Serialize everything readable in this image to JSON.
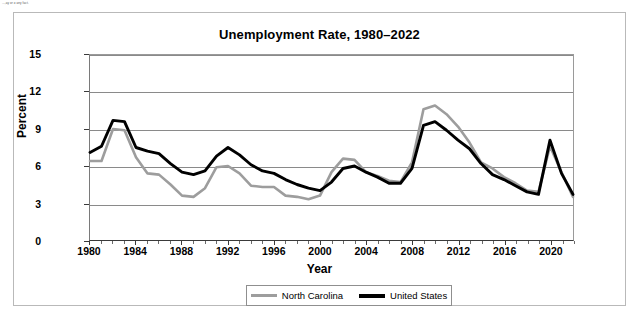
{
  "page": {
    "top_note": "...,ay or o any fact."
  },
  "chart_data": {
    "type": "line",
    "title": "Unemployment Rate, 1980–2022",
    "xlabel": "Year",
    "ylabel": "Percent",
    "xlim": [
      1980,
      2022
    ],
    "ylim": [
      0,
      15
    ],
    "yticks": [
      0,
      3,
      6,
      9,
      12,
      15
    ],
    "xticks": [
      1980,
      1984,
      1988,
      1992,
      1996,
      2000,
      2004,
      2008,
      2012,
      2016,
      2020
    ],
    "grid": "horizontal",
    "legend_position": "bottom",
    "x": [
      1980,
      1981,
      1982,
      1983,
      1984,
      1985,
      1986,
      1987,
      1988,
      1989,
      1990,
      1991,
      1992,
      1993,
      1994,
      1995,
      1996,
      1997,
      1998,
      1999,
      2000,
      2001,
      2002,
      2003,
      2004,
      2005,
      2006,
      2007,
      2008,
      2009,
      2010,
      2011,
      2012,
      2013,
      2014,
      2015,
      2016,
      2017,
      2018,
      2019,
      2020,
      2021,
      2022
    ],
    "series": [
      {
        "name": "North Carolina",
        "color": "#9d9d9d",
        "values": [
          6.4,
          6.4,
          9.0,
          8.9,
          6.7,
          5.4,
          5.3,
          4.5,
          3.6,
          3.5,
          4.2,
          5.9,
          6.0,
          5.4,
          4.4,
          4.3,
          4.3,
          3.6,
          3.5,
          3.3,
          3.6,
          5.5,
          6.6,
          6.5,
          5.5,
          5.2,
          4.8,
          4.7,
          6.3,
          10.6,
          10.9,
          10.2,
          9.2,
          7.9,
          6.3,
          5.8,
          5.1,
          4.6,
          4.0,
          3.9,
          7.6,
          5.5,
          3.5
        ]
      },
      {
        "name": "United States",
        "color": "#000000",
        "values": [
          7.1,
          7.6,
          9.7,
          9.6,
          7.5,
          7.2,
          7.0,
          6.2,
          5.5,
          5.3,
          5.6,
          6.8,
          7.5,
          6.9,
          6.1,
          5.6,
          5.4,
          4.9,
          4.5,
          4.2,
          4.0,
          4.7,
          5.8,
          6.0,
          5.5,
          5.1,
          4.6,
          4.6,
          5.8,
          9.3,
          9.6,
          8.9,
          8.1,
          7.4,
          6.2,
          5.3,
          4.9,
          4.4,
          3.9,
          3.7,
          8.1,
          5.4,
          3.7
        ]
      }
    ]
  },
  "legend": {
    "entries": [
      {
        "label": "North Carolina"
      },
      {
        "label": "United States"
      }
    ]
  }
}
